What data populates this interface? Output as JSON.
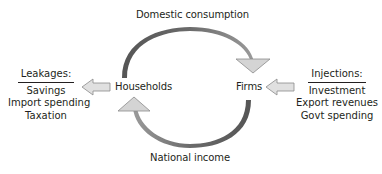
{
  "diagram": {
    "top_flow_label": "Domestic consumption",
    "bottom_flow_label": "National income",
    "nodes": {
      "households": "Households",
      "firms": "Firms"
    },
    "leakages": {
      "heading": "Leakages:",
      "items": [
        "Savings",
        "Import spending",
        "Taxation"
      ]
    },
    "injections": {
      "heading": "Injections:",
      "items": [
        "Investment",
        "Export revenues",
        "Govt spending"
      ]
    },
    "colors": {
      "arc_dark": "#5a5a5a",
      "arc_light": "#a8a8a8",
      "arrow_fill": "#d4d4d4",
      "arrow_stroke": "#8a8a8a",
      "text": "#231f20"
    }
  }
}
